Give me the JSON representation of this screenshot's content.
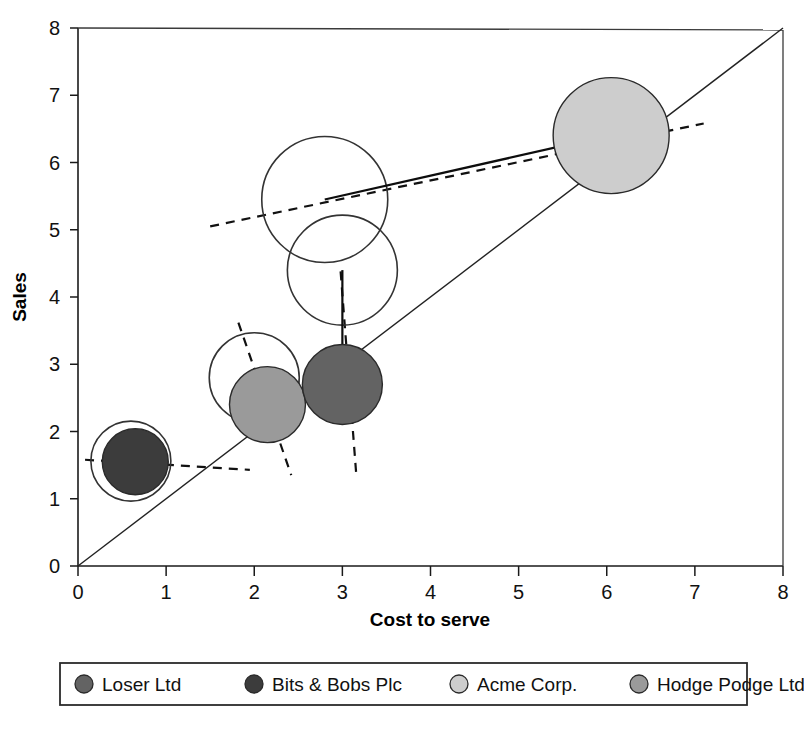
{
  "chart_data": {
    "type": "scatter",
    "title": "",
    "xlabel": "Cost to serve",
    "ylabel": "Sales",
    "xlim": [
      0,
      8
    ],
    "ylim": [
      0,
      8
    ],
    "xticks": [
      "0",
      "1",
      "2",
      "3",
      "4",
      "5",
      "6",
      "7",
      "8"
    ],
    "yticks": [
      "0",
      "1",
      "2",
      "3",
      "4",
      "5",
      "6",
      "7",
      "8"
    ],
    "grid": false,
    "legend_position": "bottom",
    "reference_line": {
      "name": "break-even-diagonal",
      "from": [
        0,
        0
      ],
      "to": [
        8,
        8
      ],
      "style": "solid"
    },
    "series": [
      {
        "name": "Bits & Bobs Plc",
        "color": "#3c3c3c",
        "current": {
          "x": 0.65,
          "y": 1.55,
          "r_px": 33
        },
        "previous": {
          "x": 0.6,
          "y": 1.56,
          "r_px": 40
        },
        "arrow_to": [
          0.86,
          1.55
        ],
        "trend_from": [
          0.08,
          1.58
        ],
        "trend_to": [
          1.95,
          1.43
        ]
      },
      {
        "name": "Hodge Podge Ltd",
        "color": "#9a9a9a",
        "current": {
          "x": 2.15,
          "y": 2.4,
          "r_px": 38
        },
        "previous": {
          "x": 2.0,
          "y": 2.8,
          "r_px": 45
        },
        "arrow_to": [
          2.16,
          2.32
        ],
        "trend_from": [
          1.82,
          3.62
        ],
        "trend_to": [
          2.42,
          1.35
        ]
      },
      {
        "name": "Loser Ltd",
        "color": "#636363",
        "current": {
          "x": 3.0,
          "y": 2.7,
          "r_px": 40
        },
        "previous": {
          "x": 3.0,
          "y": 4.4,
          "r_px": 55
        },
        "arrow_to": [
          3.0,
          2.62
        ],
        "trend_from": [
          2.98,
          4.38
        ],
        "trend_to": [
          3.16,
          1.32
        ]
      },
      {
        "name": "Acme Corp.",
        "color": "#cdcdcd",
        "current": {
          "x": 6.05,
          "y": 6.4,
          "r_px": 58
        },
        "previous": {
          "x": 2.8,
          "y": 5.45,
          "r_px": 63
        },
        "arrow_to": [
          5.95,
          6.38
        ],
        "trend_from": [
          1.5,
          5.05
        ],
        "trend_to": [
          7.1,
          6.58
        ]
      }
    ],
    "legend": [
      {
        "label": "Loser Ltd",
        "color": "#636363"
      },
      {
        "label": "Bits & Bobs Plc",
        "color": "#3c3c3c"
      },
      {
        "label": "Acme Corp.",
        "color": "#cdcdcd"
      },
      {
        "label": "Hodge Podge Ltd",
        "color": "#9a9a9a"
      }
    ]
  }
}
